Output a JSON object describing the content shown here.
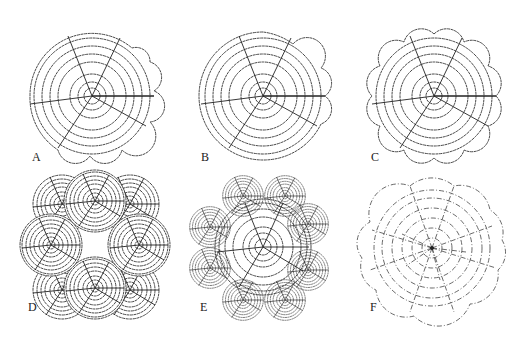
{
  "figure": {
    "panels": [
      {
        "id": "A",
        "label": "A",
        "cx": 92,
        "cy": 96,
        "outline": "scalloped-partial",
        "rings": [
          8,
          14,
          22,
          34,
          42,
          50,
          58
        ],
        "outer": 62
      },
      {
        "id": "B",
        "label": "B",
        "cx": 263,
        "cy": 96,
        "outline": "scalloped-right",
        "rings": [
          8,
          14,
          22,
          34,
          42,
          50,
          58
        ],
        "outer": 62
      },
      {
        "id": "C",
        "label": "C",
        "cx": 434,
        "cy": 96,
        "outline": "scalloped-full",
        "rings": [
          8,
          14,
          22,
          34,
          42,
          50,
          58
        ],
        "outer": 62
      },
      {
        "id": "D",
        "label": "D",
        "cx": 95,
        "cy": 248,
        "outline": "six-overlapping-circles"
      },
      {
        "id": "E",
        "label": "E",
        "cx": 262,
        "cy": 248,
        "outline": "central-circle-with-eight-satellites"
      },
      {
        "id": "F",
        "label": "F",
        "cx": 432,
        "cy": 248,
        "outline": "scalloped-dashed"
      }
    ],
    "label_positions": {
      "A": [
        32,
        150
      ],
      "B": [
        201,
        150
      ],
      "C": [
        371,
        150
      ],
      "D": [
        28,
        300
      ],
      "E": [
        200,
        300
      ],
      "F": [
        370,
        300
      ]
    }
  }
}
